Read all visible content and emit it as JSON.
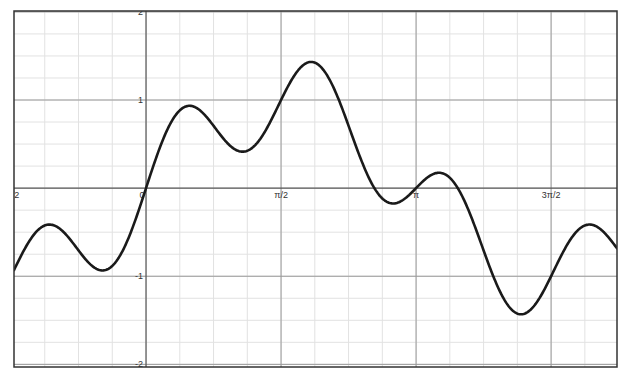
{
  "chart_data": {
    "type": "line",
    "title": "",
    "xlabel": "",
    "ylabel": "",
    "function": "sin(x) + 0.5*sin(4x)",
    "xlim": [
      -1.536,
      5.479
    ],
    "ylim": [
      -2.03,
      2.01
    ],
    "grid": {
      "major": true,
      "minor": true,
      "x_major_step": "π/2",
      "y_major_step": 1,
      "minor_per_major": 4
    },
    "legend": null,
    "x_tick_labels": [
      {
        "value": -1.5708,
        "label": "-π/2",
        "visible_text": "2"
      },
      {
        "value": 0,
        "label": "0"
      },
      {
        "value": 1.5708,
        "label": "π/2"
      },
      {
        "value": 3.1416,
        "label": "π"
      },
      {
        "value": 4.7124,
        "label": "3π/2"
      }
    ],
    "y_tick_labels": [
      {
        "value": 2,
        "label": "2"
      },
      {
        "value": 1,
        "label": "1"
      },
      {
        "value": -1,
        "label": "-1"
      },
      {
        "value": -2,
        "label": "-2"
      }
    ],
    "series": [
      {
        "name": "f(x)",
        "color": "#1a1a1a",
        "key_points": [
          {
            "x": -1.536,
            "y": -0.97,
            "note": "left edge"
          },
          {
            "x": -1.094,
            "y": -0.42,
            "note": "local max"
          },
          {
            "x": -0.49,
            "y": -0.93,
            "note": "local min"
          },
          {
            "x": 0.0,
            "y": 0.0,
            "note": "zero crossing"
          },
          {
            "x": 0.51,
            "y": 0.94,
            "note": "local max"
          },
          {
            "x": 1.14,
            "y": 0.41,
            "note": "local min"
          },
          {
            "x": 1.5708,
            "y": 1.0
          },
          {
            "x": 1.955,
            "y": 1.43,
            "note": "global max"
          },
          {
            "x": 2.69,
            "y": -0.17,
            "note": "local min"
          },
          {
            "x": 3.1416,
            "y": 0.0
          },
          {
            "x": 3.43,
            "y": 0.16,
            "note": "local max"
          },
          {
            "x": 4.32,
            "y": -1.45,
            "note": "global min"
          },
          {
            "x": 4.7124,
            "y": -1.0
          },
          {
            "x": 5.17,
            "y": -0.43,
            "note": "local max"
          },
          {
            "x": 5.479,
            "y": -0.74,
            "note": "right edge"
          }
        ]
      }
    ]
  },
  "colors": {
    "background": "#ffffff",
    "frame": "#333333",
    "axis": "#555555",
    "major_grid": "#9a9a9a",
    "minor_grid": "#e2e2e2",
    "curve": "#1a1a1a"
  }
}
